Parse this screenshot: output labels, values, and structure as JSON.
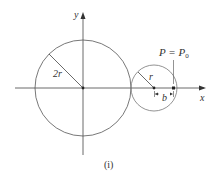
{
  "diagram": {
    "axis_x_label": "x",
    "axis_y_label": "y",
    "big_radius_label": "2r",
    "small_radius_label": "r",
    "offset_label": "b",
    "point_label": "P = P",
    "point_subscript": "0",
    "caption": "(i)",
    "stroke_color": "#555555"
  }
}
